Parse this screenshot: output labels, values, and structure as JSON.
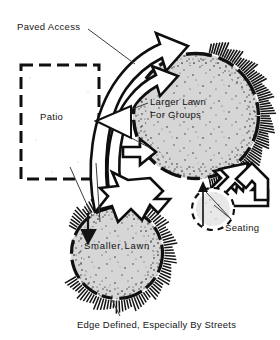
{
  "figure": {
    "type": "landscape-plan-diagram",
    "background_color": "#ffffff",
    "ink_color": "#111111",
    "lawn_fill_color": "#d4d4d4"
  },
  "labels": {
    "paved_access": "Paved Access",
    "patio": "Patio",
    "larger_lawn_line1": "Larger Lawn",
    "larger_lawn_line2": "For Groups",
    "seating": "Seating",
    "smaller_lawn": "Smaller Lawn",
    "caption": "Edge Defined, Especially By Streets"
  },
  "elements": {
    "patio_region": "dashed-rectangle",
    "larger_lawn_region": "stippled-circle-with-hatched-edge",
    "smaller_lawn_region": "stippled-circle-with-hatched-edge",
    "paved_access_arrow": "curved-double-arrow",
    "connector_arrow": "zigzag-down-arrow",
    "seating_arrow": "angled-arrow"
  }
}
